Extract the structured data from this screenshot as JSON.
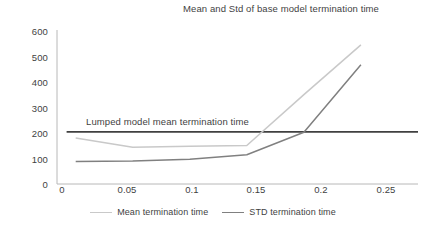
{
  "chart_data": {
    "type": "line",
    "title": "Mean and Std of base model termination time",
    "xlabel": "",
    "ylabel": "",
    "x": [
      0,
      0.05,
      0.1,
      0.15,
      0.2,
      0.25
    ],
    "xlim": [
      -0.012,
      0.272
    ],
    "ylim": [
      0,
      620
    ],
    "grid": false,
    "legend_position": "bottom",
    "xticks": [
      "0",
      "0.05",
      "0.1",
      "0.15",
      "0.2",
      "0.25"
    ],
    "yticks": [
      "0",
      "100",
      "200",
      "300",
      "400",
      "500",
      "600"
    ],
    "ytick_values": [
      0,
      100,
      200,
      300,
      400,
      500,
      600
    ],
    "series": [
      {
        "name": "Mean termination time",
        "color": "#c9c9c9",
        "values": [
          185,
          148,
          152,
          155,
          360,
          560
        ]
      },
      {
        "name": "STD termination time",
        "color": "#808080",
        "values": [
          90,
          92,
          100,
          118,
          208,
          480
        ]
      },
      {
        "name": "Lumped model mean termination time",
        "color": "#404040",
        "values": [
          210,
          210,
          210,
          210,
          210,
          210
        ]
      }
    ],
    "annotations": [
      {
        "text": "Lumped model mean termination time",
        "x": 0.028,
        "y": 240
      }
    ]
  },
  "legend": {
    "entries": [
      {
        "label": "Mean termination time",
        "color": "#c9c9c9"
      },
      {
        "label": "STD termination time",
        "color": "#808080"
      }
    ]
  }
}
